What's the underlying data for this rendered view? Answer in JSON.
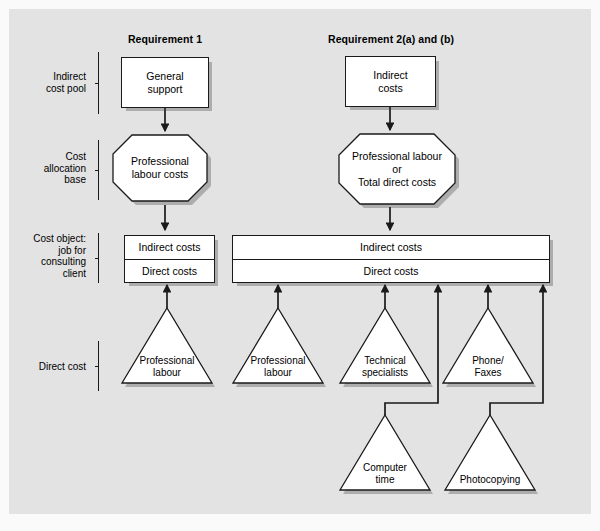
{
  "headers": [
    {
      "label": "Requirement 1"
    },
    {
      "label": "Requirement 2(a) and (b)"
    }
  ],
  "row_labels": [
    {
      "label": "Indirect\ncost pool"
    },
    {
      "label": "Cost\nallocation\nbase"
    },
    {
      "label": "Cost object:\njob for\nconsulting\nclient"
    },
    {
      "label": "Direct cost"
    }
  ],
  "cost_pools": [
    {
      "label": "General\nsupport"
    },
    {
      "label": "Indirect\ncosts"
    }
  ],
  "allocation_bases": [
    {
      "label": "Professional\nlabour costs"
    },
    {
      "label": "Professional labour\nor\nTotal direct costs"
    }
  ],
  "cost_objects": [
    {
      "indirect": "Indirect costs",
      "direct": "Direct costs"
    },
    {
      "indirect": "Indirect costs",
      "direct": "Direct costs"
    }
  ],
  "direct_costs": [
    {
      "label": "Professional\nlabour"
    },
    {
      "label": "Professional\nlabour"
    },
    {
      "label": "Technical\nspecialists"
    },
    {
      "label": "Phone/\nFaxes"
    },
    {
      "label": "Computer\ntime"
    },
    {
      "label": "Photocopying"
    }
  ],
  "colors": {
    "panel_bg": "#e3e3e3",
    "page_bg": "#ffffff",
    "shape_fill": "#ffffff",
    "stroke": "#1a1a1a",
    "shadow": "rgba(60,60,60,0.32)",
    "text": "#000000"
  }
}
